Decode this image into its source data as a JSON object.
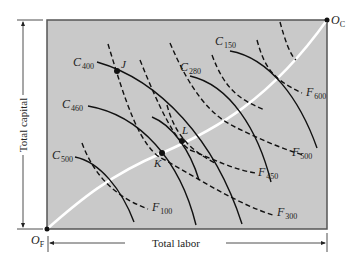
{
  "diagram": {
    "type": "edgeworth-box",
    "box_fill": "#c9c9c9",
    "contract_curve_color": "#ffffff",
    "origins": {
      "bottom_left": {
        "main": "O",
        "sub": "F"
      },
      "top_right": {
        "main": "O",
        "sub": "C"
      }
    },
    "axes": {
      "vertical_label": "Total capital",
      "horizontal_label": "Total labor"
    },
    "isoquants_C": [
      {
        "main": "C",
        "sub": "400"
      },
      {
        "main": "C",
        "sub": "460"
      },
      {
        "main": "C",
        "sub": "500"
      },
      {
        "main": "C",
        "sub": "280"
      },
      {
        "main": "C",
        "sub": "150"
      }
    ],
    "isoquants_F": [
      {
        "main": "F",
        "sub": "100"
      },
      {
        "main": "F",
        "sub": "300"
      },
      {
        "main": "F",
        "sub": "450"
      },
      {
        "main": "F",
        "sub": "500"
      },
      {
        "main": "F",
        "sub": "600"
      }
    ],
    "points": [
      {
        "label": "J"
      },
      {
        "label": "K"
      },
      {
        "label": "L"
      }
    ]
  }
}
